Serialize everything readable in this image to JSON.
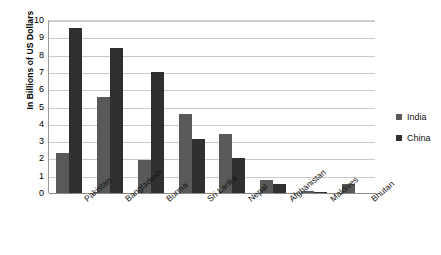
{
  "chart_data": {
    "type": "bar",
    "title": "",
    "xlabel": "",
    "ylabel": "In Billions of US Dollars",
    "ylim": [
      0,
      10
    ],
    "ytick_step": 1,
    "yticks": [
      "10",
      "9",
      "8",
      "7",
      "6",
      "5",
      "4",
      "3",
      "2",
      "1",
      "0"
    ],
    "grid": true,
    "legend_position": "right",
    "categories": [
      "Pakistan",
      "Bangladesh",
      "Burma",
      "Sri Lanka",
      "Nepal",
      "Afghanistan",
      "Maldives",
      "Bhutan"
    ],
    "series": [
      {
        "name": "India",
        "color": "#595959",
        "values": [
          2.3,
          5.55,
          1.9,
          4.55,
          3.4,
          0.75,
          0.1,
          0.5
        ]
      },
      {
        "name": "China",
        "color": "#303030",
        "values": [
          9.55,
          8.4,
          7.0,
          3.15,
          2.0,
          0.5,
          0.08,
          0.0
        ]
      }
    ]
  },
  "legend": {
    "items": [
      {
        "label": "India",
        "color": "#595959"
      },
      {
        "label": "China",
        "color": "#303030"
      }
    ]
  }
}
